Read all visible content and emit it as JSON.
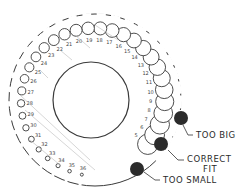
{
  "diagram": {
    "gauge_numbers": [
      "5",
      "6",
      "7",
      "8",
      "9",
      "10",
      "11",
      "12",
      "13",
      "14",
      "15",
      "16",
      "17",
      "18",
      "19",
      "20",
      "21",
      "22",
      "23",
      "24",
      "25",
      "26",
      "27",
      "28",
      "29",
      "30",
      "31",
      "32",
      "33",
      "34",
      "35",
      "36"
    ],
    "callouts": [
      {
        "id": "too-big",
        "label": "TOO BIG"
      },
      {
        "id": "correct-fit",
        "label_line1": "CORRECT",
        "label_line2": "FIT"
      },
      {
        "id": "too-small",
        "label": "TOO SMALL"
      }
    ],
    "colors": {
      "line": "#3a3a3a",
      "wire": "#2b2b2b",
      "background": "#ffffff"
    }
  }
}
